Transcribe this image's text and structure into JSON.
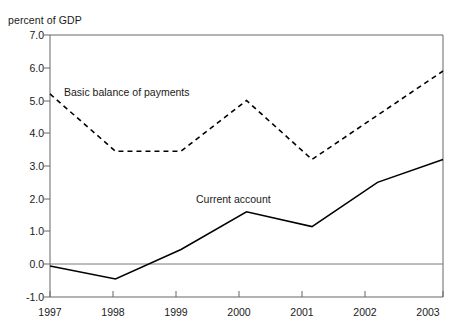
{
  "chart_data": {
    "type": "line",
    "title": "",
    "xlabel": "",
    "ylabel": "percent of GDP",
    "x": [
      1997,
      1998,
      1999,
      2000,
      2001,
      2002,
      2003
    ],
    "xtick_labels": [
      "1997",
      "1998",
      "1999",
      "2000",
      "2001",
      "2002",
      "2003"
    ],
    "ytick_labels": [
      "7.0",
      "6.0",
      "5.0",
      "4.0",
      "3.0",
      "2.0",
      "1.0",
      "0.0",
      "-1.0"
    ],
    "yticks": [
      7.0,
      6.0,
      5.0,
      4.0,
      3.0,
      2.0,
      1.0,
      0.0,
      -1.0
    ],
    "ylim": [
      -1.0,
      7.0
    ],
    "xlim": [
      1997,
      2003
    ],
    "grid": false,
    "zero_line": true,
    "legend_position": "inline-annotations",
    "series": [
      {
        "name": "Basic balance of payments",
        "style": "dashed",
        "color": "#000000",
        "values": [
          5.2,
          3.45,
          3.45,
          5.0,
          3.2,
          4.55,
          5.9
        ]
      },
      {
        "name": "Current account",
        "style": "solid",
        "color": "#000000",
        "values": [
          -0.05,
          -0.45,
          0.45,
          1.6,
          1.15,
          2.5,
          3.2
        ]
      }
    ],
    "annotations": [
      {
        "text": "Basic balance of payments",
        "x_px": 64,
        "y_px": 92
      },
      {
        "text": "Current account",
        "x_px": 196,
        "y_px": 200
      }
    ]
  },
  "axis": {
    "y_unit_label": "percent of GDP"
  }
}
